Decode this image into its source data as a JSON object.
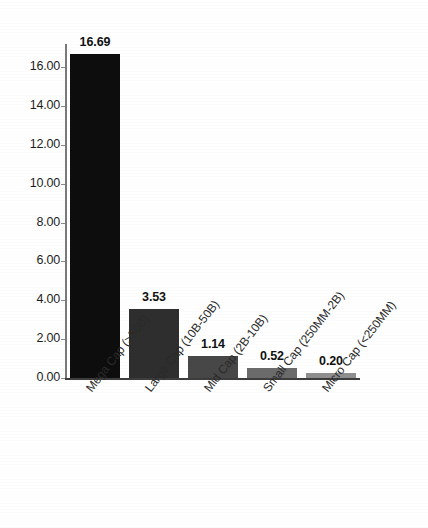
{
  "chart_data": {
    "type": "bar",
    "title": "",
    "subtitle": "",
    "xlabel": "",
    "ylabel": "",
    "categories": [
      "Mega Cap (>50B)",
      "Large Cap (10B-50B)",
      "Mid Cap (2B-10B)",
      "Small Cap (250MM-2B)",
      "Micro Cap (<250MM)"
    ],
    "values": [
      16.69,
      3.53,
      1.14,
      0.52,
      0.2
    ],
    "value_labels": [
      "16.69",
      "3.53",
      "1.14",
      "0.52",
      "0.20"
    ],
    "bar_colors": [
      "#0d0d0d",
      "#2e2e2e",
      "#474747",
      "#6b6b6b",
      "#8f8f8f"
    ],
    "ylim": [
      0.0,
      17.2
    ],
    "ytick_labels": [
      "0.00",
      "2.00",
      "4.00",
      "6.00",
      "8.00",
      "10.00",
      "12.00",
      "14.00",
      "16.00"
    ],
    "ytick_values": [
      0,
      2,
      4,
      6,
      8,
      10,
      12,
      14,
      16
    ],
    "grid": false,
    "legend": "none",
    "axis_color": "#3d3d3d",
    "background": "#ffffff"
  }
}
